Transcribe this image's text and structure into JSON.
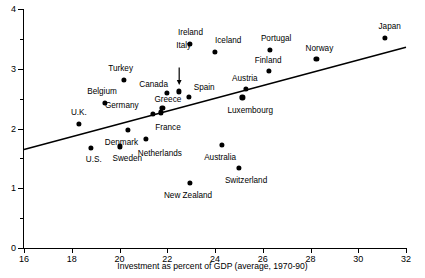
{
  "chart_data": {
    "type": "scatter",
    "title": "",
    "xlabel": "Investment as percent of GDP (average, 1970-90)",
    "ylabel": "",
    "xlim": [
      16,
      32
    ],
    "ylim": [
      0,
      4
    ],
    "xticks": [
      16,
      18,
      20,
      22,
      24,
      26,
      28,
      30,
      32
    ],
    "yticks": [
      0,
      1,
      2,
      3,
      4
    ],
    "y_minor_ticks": [
      0.5,
      1.5,
      2.5,
      3.5
    ],
    "grid": false,
    "legend": "none",
    "points": [
      {
        "label": "U.K.",
        "x": 18.3,
        "y": 2.08,
        "lx": -8,
        "ly": -15
      },
      {
        "label": "U.S.",
        "x": 18.8,
        "y": 1.67,
        "lx": -5,
        "ly": 8
      },
      {
        "label": "Belgium",
        "x": 19.4,
        "y": 2.43,
        "lx": -18,
        "ly": -15
      },
      {
        "label": "Sweden",
        "x": 20.0,
        "y": 1.7,
        "lx": -7,
        "ly": 9
      },
      {
        "label": "Turkey",
        "x": 20.2,
        "y": 2.82,
        "lx": -16,
        "ly": -15
      },
      {
        "label": "Denmark",
        "x": 20.35,
        "y": 1.97,
        "lx": -23,
        "ly": 9
      },
      {
        "label": "Netherlands",
        "x": 21.1,
        "y": 1.83,
        "lx": -8,
        "ly": 11
      },
      {
        "label": "Germany",
        "x": 21.4,
        "y": 2.25,
        "lx": -48,
        "ly": -12
      },
      {
        "label": "France",
        "x": 21.75,
        "y": 2.27,
        "lx": -6,
        "ly": 12
      },
      {
        "label": "Greece",
        "x": 21.8,
        "y": 2.35,
        "lx": -8,
        "ly": -12
      },
      {
        "label": "Canada",
        "x": 22.0,
        "y": 2.6,
        "lx": -28,
        "ly": -12
      },
      {
        "label": "Italy",
        "x": 22.5,
        "y": 2.62,
        "lx": -3,
        "ly": -49
      },
      {
        "label": "Spain",
        "x": 22.9,
        "y": 2.53,
        "lx": 5,
        "ly": -13
      },
      {
        "label": "Ireland",
        "x": 22.95,
        "y": 3.42,
        "lx": -12,
        "ly": -15
      },
      {
        "label": "New Zealand",
        "x": 22.95,
        "y": 1.09,
        "lx": -26,
        "ly": 9
      },
      {
        "label": "Iceland",
        "x": 24.0,
        "y": 3.28,
        "lx": 0,
        "ly": -15
      },
      {
        "label": "Australia",
        "x": 24.3,
        "y": 1.73,
        "lx": -18,
        "ly": 9
      },
      {
        "label": "Switzerland",
        "x": 25.0,
        "y": 1.34,
        "lx": -14,
        "ly": 9
      },
      {
        "label": "Luxembourg",
        "x": 25.15,
        "y": 2.52,
        "lx": -15,
        "ly": 10
      },
      {
        "label": "Austria",
        "x": 25.3,
        "y": 2.66,
        "lx": -14,
        "ly": -14
      },
      {
        "label": "Finland",
        "x": 26.25,
        "y": 2.96,
        "lx": -14,
        "ly": -14
      },
      {
        "label": "Portugal",
        "x": 26.3,
        "y": 3.32,
        "lx": -9,
        "ly": -15
      },
      {
        "label": "Norway",
        "x": 28.25,
        "y": 3.16,
        "lx": -11,
        "ly": -14
      },
      {
        "label": "Japan",
        "x": 31.1,
        "y": 3.51,
        "lx": -6,
        "ly": -15
      }
    ],
    "fit_line": {
      "x1": 16,
      "y1": 1.65,
      "x2": 32,
      "y2": 3.36
    },
    "annotations": [
      {
        "name": "italy-arrow",
        "from_x": 22.5,
        "from_y": 3.02,
        "to_x": 22.5,
        "to_y": 2.73
      }
    ]
  }
}
